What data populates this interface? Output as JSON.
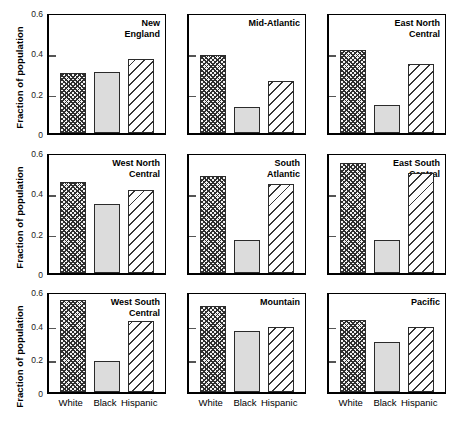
{
  "figure": {
    "ylabel": "Fraction of population",
    "categories": [
      "White",
      "Black",
      "Hispanic"
    ],
    "yticks": [
      "0",
      "0.2",
      "0.4",
      "0.6"
    ]
  },
  "chart_data": {
    "type": "bar",
    "title": "",
    "xlabel": "",
    "ylabel": "Fraction of population",
    "ylim": [
      0,
      0.6
    ],
    "yticks": [
      0,
      0.2,
      0.4,
      0.6
    ],
    "grid": false,
    "legend": "none",
    "categories": [
      "White",
      "Black",
      "Hispanic"
    ],
    "panel_layout": [
      3,
      3
    ],
    "panels": [
      {
        "title": "New England",
        "title_lines": [
          "New",
          "England"
        ],
        "values": [
          0.3,
          0.305,
          0.365
        ]
      },
      {
        "title": "Mid-Atlantic",
        "title_lines": [
          "Mid-Atlantic"
        ],
        "values": [
          0.385,
          0.13,
          0.26
        ]
      },
      {
        "title": "East North Central",
        "title_lines": [
          "East North",
          "Central"
        ],
        "values": [
          0.41,
          0.14,
          0.34
        ]
      },
      {
        "title": "West North Central",
        "title_lines": [
          "West North",
          "Central"
        ],
        "values": [
          0.45,
          0.34,
          0.41
        ]
      },
      {
        "title": "South Atlantic",
        "title_lines": [
          "South",
          "Atlantic"
        ],
        "values": [
          0.48,
          0.165,
          0.44
        ]
      },
      {
        "title": "East South Central",
        "title_lines": [
          "East South",
          "Central"
        ],
        "values": [
          0.545,
          0.165,
          0.495
        ]
      },
      {
        "title": "West South Central",
        "title_lines": [
          "West South",
          "Central"
        ],
        "values": [
          0.545,
          0.185,
          0.42
        ]
      },
      {
        "title": "Mountain",
        "title_lines": [
          "Mountain"
        ],
        "values": [
          0.51,
          0.365,
          0.385
        ]
      },
      {
        "title": "Pacific",
        "title_lines": [
          "Pacific"
        ],
        "values": [
          0.43,
          0.3,
          0.385
        ]
      }
    ],
    "series_styles": [
      {
        "name": "White",
        "fill": "crosshatch-dark",
        "color": "#2e2e2e"
      },
      {
        "name": "Black",
        "fill": "solid-gray",
        "color": "#dcdcdc"
      },
      {
        "name": "Hispanic",
        "fill": "diagonal-stripes",
        "color": "#333333"
      }
    ]
  }
}
